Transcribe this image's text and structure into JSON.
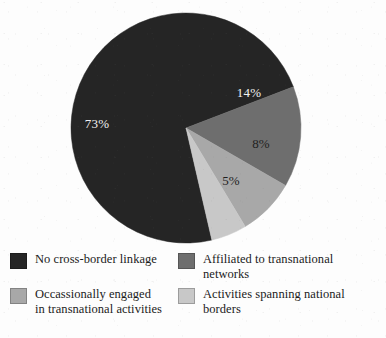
{
  "figure": {
    "background_color": "#fdfdfd"
  },
  "chart_data": {
    "type": "pie",
    "title": "",
    "subtitle": "",
    "xlabel": "",
    "ylabel": "",
    "legend_position": "bottom",
    "grid": false,
    "units": "percent",
    "total": 100,
    "categories": [
      "No cross-border linkage",
      "Affiliated to transnational networks",
      "Occassionally engaged in transnational activities",
      "Activities spanning national borders"
    ],
    "values": [
      73,
      14,
      8,
      5
    ],
    "data_labels": [
      "73%",
      "14%",
      "8%",
      "5%"
    ],
    "colors": [
      "#252525",
      "#6e6e6e",
      "#a8a8a8",
      "#c8c8c8"
    ],
    "slices": [
      {
        "label": "No cross-border linkage",
        "value": 73,
        "data_label": "73%",
        "color": "#252525",
        "start_angle": 77,
        "end_angle": 339,
        "label_x": 97,
        "label_y": 125,
        "label_tone": "on-dark"
      },
      {
        "label": "Affiliated to transnational networks",
        "value": 14,
        "data_label": "14%",
        "color": "#6e6e6e",
        "start_angle": 339,
        "end_angle": 390,
        "label_x": 249,
        "label_y": 94,
        "label_tone": "on-dark"
      },
      {
        "label": "Activities spanning national borders",
        "value": 8,
        "data_label": "8%",
        "color": "#a8a8a8",
        "start_angle": 390,
        "end_angle": 419,
        "label_x": 261,
        "label_y": 145,
        "label_tone": "on-light"
      },
      {
        "label": "Occassionally engaged in transnational activities",
        "value": 5,
        "data_label": "5%",
        "color": "#c8c8c8",
        "start_angle": 419,
        "end_angle": 437,
        "label_x": 231,
        "label_y": 182,
        "label_tone": "on-light"
      }
    ],
    "geometry": {
      "center_x": 186,
      "center_y": 128,
      "radius": 115
    }
  },
  "legend": {
    "items": [
      {
        "label": "No cross-border linkage",
        "color": "#252525"
      },
      {
        "label": "Affiliated to transnational networks",
        "color": "#6e6e6e"
      },
      {
        "label": "Occassionally engaged\nin transnational activities",
        "color": "#a8a8a8"
      },
      {
        "label": "Activities spanning national borders",
        "color": "#c8c8c8"
      }
    ]
  }
}
